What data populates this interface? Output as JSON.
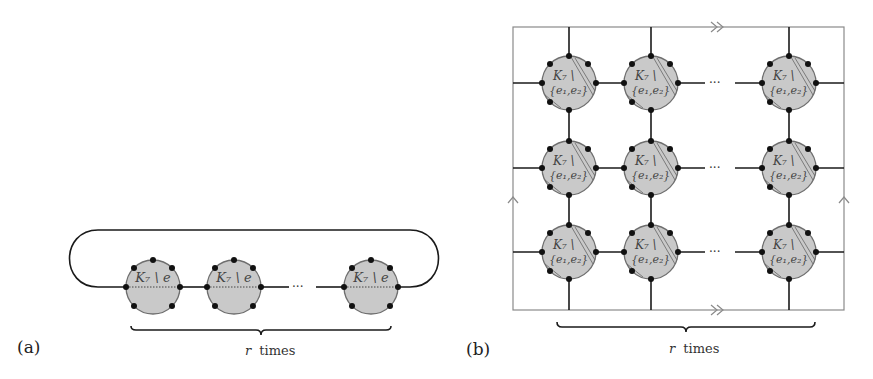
{
  "panel_a": {
    "caption": "(a)",
    "node_label": "K₇ \\ e",
    "ellipsis": "···",
    "brace_label_var": "r",
    "brace_label_text": "times",
    "node_count_shown": 3
  },
  "panel_b": {
    "caption": "(b)",
    "node_label_line1": "K₇ \\",
    "node_label_line2": "{e₁,e₂}",
    "ellipsis": "···",
    "brace_label_var": "r",
    "brace_label_text": "times",
    "rows": 3,
    "cols_shown": 3,
    "frame_markers": {
      "top_bottom": "double-arrow-right",
      "left_right": "single-arrow-up"
    }
  },
  "colors": {
    "node_fill": "#c9c9c9",
    "node_stroke": "#6e6e6e",
    "edge": "#1a1a1a",
    "frame": "#8a8a8a"
  }
}
